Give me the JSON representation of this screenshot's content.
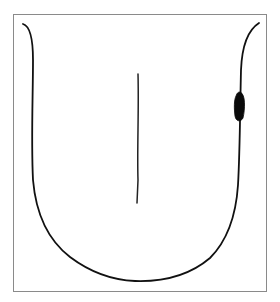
{
  "diagram": {
    "elements": [
      {
        "name": "tongue-outline",
        "shape": "U-shaped curve with flared tips"
      },
      {
        "name": "midline-groove",
        "shape": "vertical line"
      },
      {
        "name": "lesion",
        "shape": "filled dark oval",
        "location": "right lateral border"
      }
    ],
    "colors": {
      "stroke": "#111111",
      "lesion": "#0a0a0a",
      "frame": "#8a8a8a",
      "background": "#ffffff"
    },
    "text": []
  }
}
